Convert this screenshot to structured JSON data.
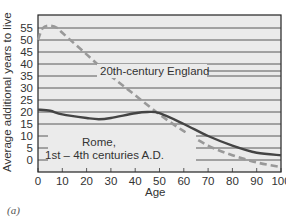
{
  "chart_data": {
    "type": "line",
    "title": "",
    "xlabel": "Age",
    "ylabel": "Average additional years to live",
    "xlim": [
      0,
      100
    ],
    "ylim": [
      -5,
      60
    ],
    "xticks": [
      0,
      10,
      20,
      30,
      40,
      50,
      60,
      70,
      80,
      90,
      100
    ],
    "yticks": [
      0,
      5,
      10,
      15,
      20,
      25,
      30,
      35,
      40,
      45,
      50,
      55
    ],
    "grid": "horizontal",
    "series": [
      {
        "name": "20th-century England",
        "style": "dashed",
        "color": "#999999",
        "x": [
          0,
          2,
          5,
          8,
          10,
          20,
          30,
          40,
          50,
          60,
          70,
          80,
          90,
          100
        ],
        "values": [
          50,
          55,
          56,
          55,
          53,
          44,
          35,
          27,
          19,
          12,
          6,
          2,
          -1,
          -3
        ]
      },
      {
        "name": "Rome, 1st – 4th centuries A.D.",
        "style": "solid",
        "color": "#444444",
        "x": [
          0,
          5,
          10,
          20,
          25,
          30,
          40,
          45,
          50,
          60,
          70,
          80,
          90,
          100
        ],
        "values": [
          21,
          20.5,
          19,
          17.5,
          17,
          17.5,
          19.5,
          20,
          19.5,
          15,
          10,
          6,
          3,
          2
        ]
      }
    ],
    "annotations": [
      "20th-century England",
      "Rome,",
      "1st – 4th centuries A.D."
    ]
  },
  "labels": {
    "xlabel": "Age",
    "ylabel": "Average additional years to live",
    "england": "20th-century England",
    "rome1": "Rome,",
    "rome2": "1st – 4th centuries A.D.",
    "caption": "(a)"
  }
}
